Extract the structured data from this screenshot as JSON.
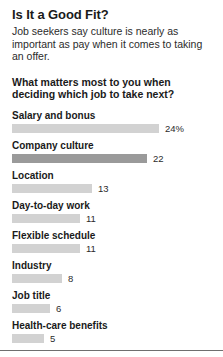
{
  "headline": "Is It a Good Fit?",
  "deck": "Job seekers say culture is nearly as important as pay when it comes to taking an offer.",
  "question": "What matters most to you when deciding which job to take next?",
  "colors": {
    "bar_default": "#d2d2d2",
    "bar_accent": "#9a9a9a",
    "text": "#1a1a1a",
    "rule": "#6f6f6f"
  },
  "chart_data": {
    "type": "bar",
    "orientation": "horizontal",
    "title": "What matters most to you when deciding which job to take next?",
    "xlabel": "",
    "ylabel": "",
    "xlim": [
      0,
      24
    ],
    "grid": false,
    "legend": false,
    "unit": "percent",
    "categories": [
      "Salary and bonus",
      "Company culture",
      "Location",
      "Day-to-day work",
      "Flexible schedule",
      "Industry",
      "Job title",
      "Health-care benefits"
    ],
    "values": [
      24,
      22,
      13,
      11,
      11,
      8,
      6,
      5
    ],
    "value_labels": [
      "24%",
      "22",
      "13",
      "11",
      "11",
      "8",
      "6",
      "5"
    ],
    "bars": [
      {
        "label": "Salary and bonus",
        "value": 24,
        "value_label": "24%",
        "width_px": 147,
        "accent": false
      },
      {
        "label": "Company culture",
        "value": 22,
        "value_label": "22",
        "width_px": 135,
        "accent": true
      },
      {
        "label": "Location",
        "value": 13,
        "value_label": "13",
        "width_px": 80,
        "accent": false
      },
      {
        "label": "Day-to-day work",
        "value": 11,
        "value_label": "11",
        "width_px": 68,
        "accent": false
      },
      {
        "label": "Flexible schedule",
        "value": 11,
        "value_label": "11",
        "width_px": 68,
        "accent": false
      },
      {
        "label": "Industry",
        "value": 8,
        "value_label": "8",
        "width_px": 50,
        "accent": false
      },
      {
        "label": "Job title",
        "value": 6,
        "value_label": "6",
        "width_px": 38,
        "accent": false
      },
      {
        "label": "Health-care benefits",
        "value": 5,
        "value_label": "5",
        "width_px": 32,
        "accent": false
      }
    ]
  }
}
